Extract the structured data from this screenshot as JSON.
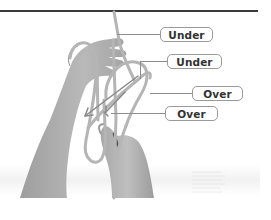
{
  "figure": {
    "rule_color": "#3a3a3a",
    "rope_color": "#b8b8b8",
    "skin_color": "#a9a9a9",
    "arrow_color": "#8a8a8a"
  },
  "callouts": [
    {
      "label": "Under"
    },
    {
      "label": "Under"
    },
    {
      "label": "Over"
    },
    {
      "label": "Over"
    }
  ]
}
